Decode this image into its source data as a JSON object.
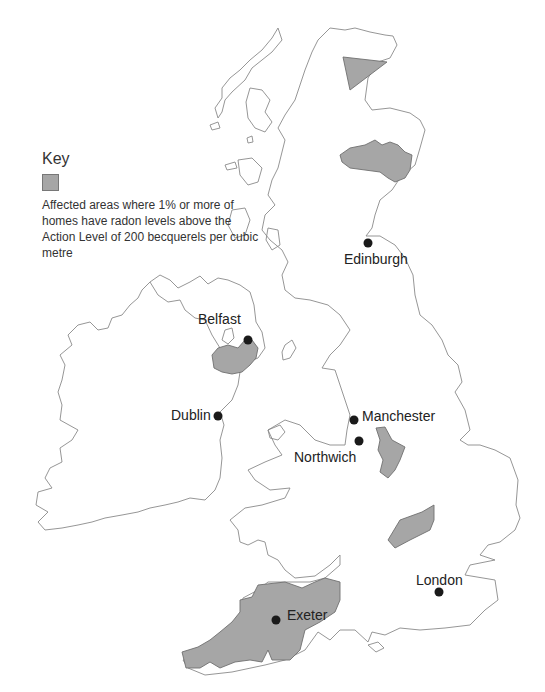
{
  "key": {
    "title": "Key",
    "swatch_color": "#a6a6a6",
    "description": "Affected areas where 1% or more of homes have radon levels above the Action Level of 200 becquerels per cubic metre"
  },
  "cities": [
    {
      "name": "Edinburgh",
      "dot": [
        368,
        243
      ],
      "label_pos": [
        344,
        253
      ]
    },
    {
      "name": "Belfast",
      "dot": [
        248,
        340
      ],
      "label_pos": [
        198,
        313
      ]
    },
    {
      "name": "Dublin",
      "dot": [
        218,
        416
      ],
      "label_pos": [
        171,
        407
      ]
    },
    {
      "name": "Manchester",
      "dot": [
        354,
        420
      ],
      "label_pos": [
        362,
        408
      ]
    },
    {
      "name": "Northwich",
      "dot": [
        359,
        441
      ],
      "label_pos": [
        294,
        449
      ]
    },
    {
      "name": "London",
      "dot": [
        439,
        592
      ],
      "label_pos": [
        416,
        572
      ]
    },
    {
      "name": "Exeter",
      "dot": [
        276,
        620
      ],
      "label_pos": [
        286,
        607
      ]
    }
  ],
  "colors": {
    "coastline": "#8a8a8a",
    "affected_area": "#a6a6a6",
    "city_dot": "#1a1a1a"
  }
}
